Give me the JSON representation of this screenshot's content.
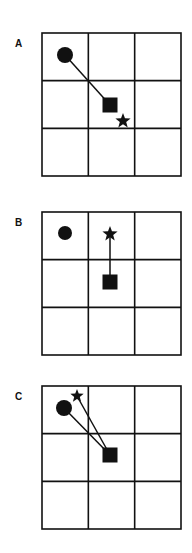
{
  "figure": {
    "colors": {
      "ink": "#111111",
      "background": "#ffffff"
    },
    "grid": {
      "rows": 3,
      "cols": 3
    },
    "panels": [
      {
        "label": "A",
        "top": 32,
        "label_top": 44,
        "circle": {
          "cx": 65,
          "cy": 23,
          "r": 8
        },
        "square": {
          "cx": 110,
          "cy": 73,
          "size": 15
        },
        "star": {
          "cx": 123,
          "cy": 89,
          "r": 8
        },
        "connections": [
          "circle-square"
        ]
      },
      {
        "label": "B",
        "top": 211,
        "label_top": 223,
        "circle": {
          "cx": 65,
          "cy": 22,
          "r": 7
        },
        "square": {
          "cx": 110,
          "cy": 71,
          "size": 15
        },
        "star": {
          "cx": 110,
          "cy": 23,
          "r": 8
        },
        "connections": [
          "star-square"
        ]
      },
      {
        "label": "C",
        "top": 385,
        "label_top": 397,
        "circle": {
          "cx": 64,
          "cy": 23,
          "r": 8
        },
        "square": {
          "cx": 110,
          "cy": 70,
          "size": 15
        },
        "star": {
          "cx": 77,
          "cy": 11,
          "r": 7
        },
        "connections": [
          "circle-square",
          "star-square"
        ]
      }
    ]
  }
}
